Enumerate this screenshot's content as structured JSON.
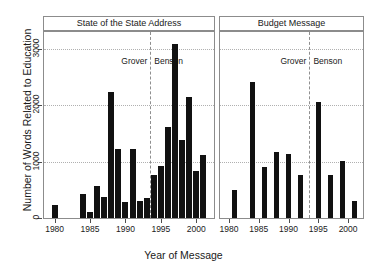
{
  "figure": {
    "ylabel": "Number of Words Related to Education",
    "xlabel": "Year of Message",
    "bar_color": "#111111",
    "grid_color": "#b0b0b0",
    "divider_color": "#8f8f8f"
  },
  "axis": {
    "yticks": [
      "0",
      "1000",
      "2000",
      "3000"
    ],
    "ytick_values": [
      0,
      1000,
      2000,
      3000
    ],
    "ylim": [
      0,
      3300
    ],
    "xticks": [
      "1980",
      "1985",
      "1990",
      "1995",
      "2000"
    ],
    "xtick_values": [
      1980,
      1985,
      1990,
      1995,
      2000
    ],
    "xlim": [
      1978.5,
      2002.5
    ]
  },
  "annotations": {
    "grover": "Grover",
    "benson": "Benson",
    "divider_year": 1993.5
  },
  "chart_data": {
    "type": "bar",
    "title": "",
    "xlabel": "Year of Message",
    "ylabel": "Number of Words Related to Education",
    "ylim": [
      0,
      3300
    ],
    "xlim": [
      1978.5,
      2002.5
    ],
    "grid": true,
    "legend": "none",
    "panels": [
      {
        "label": "State of the State Address",
        "x": [
          1980,
          1984,
          1985,
          1986,
          1987,
          1988,
          1989,
          1990,
          1991,
          1992,
          1993,
          1994,
          1995,
          1996,
          1997,
          1998,
          1999,
          2000,
          2001
        ],
        "values": [
          230,
          430,
          100,
          560,
          380,
          2240,
          1230,
          290,
          1220,
          310,
          360,
          760,
          930,
          1620,
          3090,
          1390,
          2140,
          840,
          1120
        ],
        "categories": [
          "1980",
          "1984",
          "1985",
          "1986",
          "1987",
          "1988",
          "1989",
          "1990",
          "1991",
          "1992",
          "1993",
          "1994",
          "1995",
          "1996",
          "1997",
          "1998",
          "1999",
          "2000",
          "2001"
        ]
      },
      {
        "label": "Budget Message",
        "x": [
          1981,
          1984,
          1986,
          1988,
          1990,
          1992,
          1995,
          1997,
          1999,
          2001
        ],
        "values": [
          500,
          2420,
          910,
          1180,
          1140,
          760,
          2050,
          770,
          1020,
          300
        ],
        "categories": [
          "1981",
          "1984",
          "1986",
          "1988",
          "1990",
          "1992",
          "1995",
          "1997",
          "1999",
          "2001"
        ]
      }
    ]
  }
}
